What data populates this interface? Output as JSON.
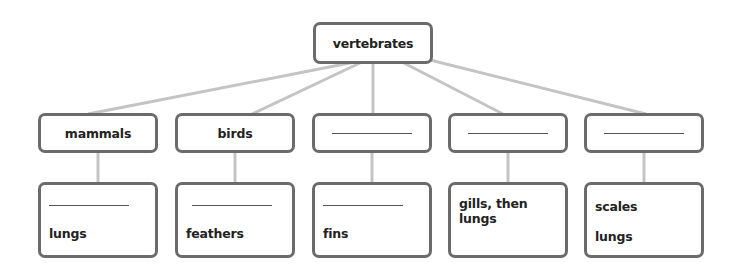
{
  "diagram": {
    "root": {
      "label": "vertebrates"
    },
    "groups": [
      {
        "name": "mammals",
        "blank": false,
        "traits": [
          {
            "blank": true
          },
          {
            "text": "lungs"
          }
        ]
      },
      {
        "name": "birds",
        "blank": false,
        "traits": [
          {
            "blank": true
          },
          {
            "text": "feathers"
          }
        ]
      },
      {
        "name": "",
        "blank": true,
        "traits": [
          {
            "blank": true
          },
          {
            "text": "fins"
          }
        ]
      },
      {
        "name": "",
        "blank": true,
        "traits": [
          {
            "text": "gills, then lungs"
          }
        ]
      },
      {
        "name": "",
        "blank": true,
        "traits": [
          {
            "text": "scales"
          },
          {
            "text": "lungs"
          }
        ]
      }
    ],
    "colors": {
      "box_border": "#6b6b6b",
      "connector": "#c4c4c4",
      "text": "#222222"
    }
  }
}
